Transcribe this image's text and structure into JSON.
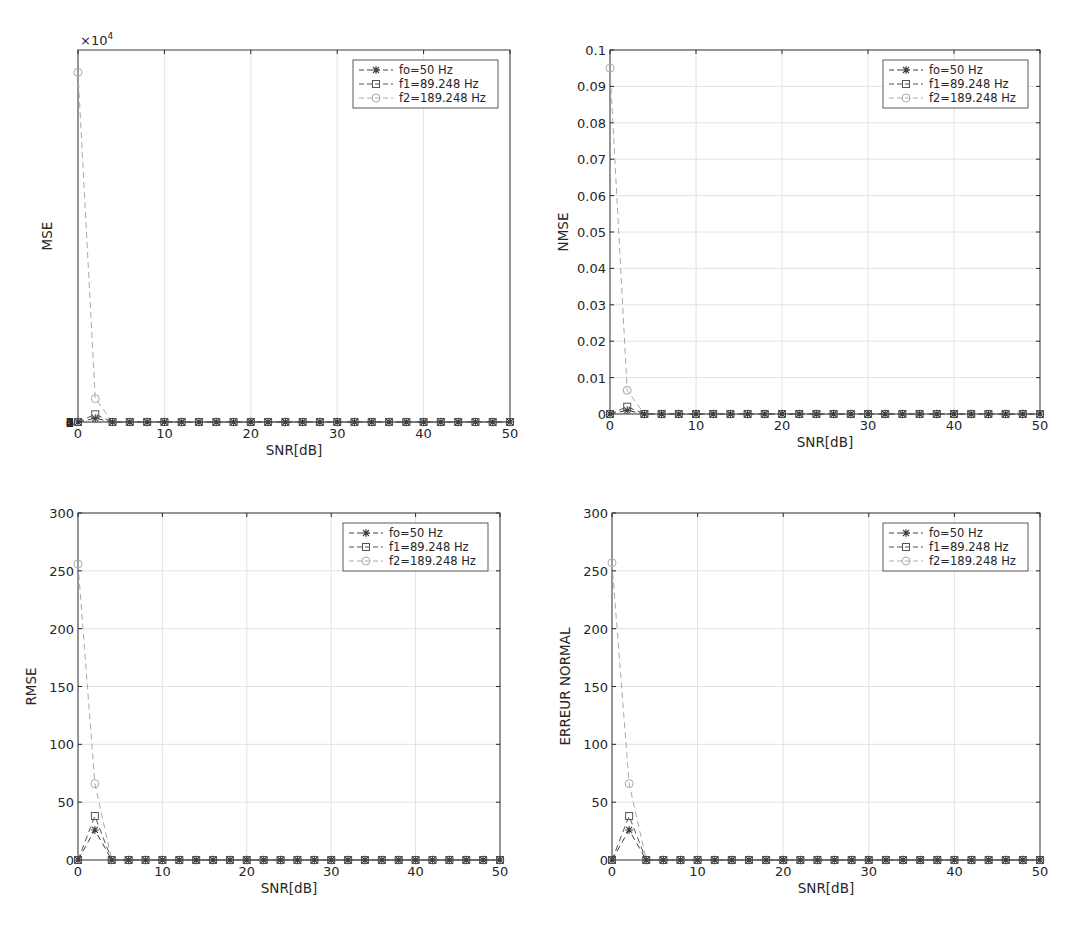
{
  "figure": {
    "layout": "2x2 subplots",
    "grid": true,
    "colors": {
      "fo": "#404040",
      "f1": "#555555",
      "f2": "#aaaaaa",
      "axis": "#262626",
      "grid": "#e2e2e2"
    }
  },
  "legend_entries": [
    {
      "label": "fo=50 Hz",
      "marker": "asterisk"
    },
    {
      "label": "f1=89.248 Hz",
      "marker": "square"
    },
    {
      "label": "f2=189.248 Hz",
      "marker": "circle"
    }
  ],
  "chart_data": [
    {
      "type": "line",
      "title": "",
      "xlabel": "SNR[dB]",
      "ylabel": "MSE",
      "y_exponent_label": "×10^4",
      "xlim": [
        0,
        50
      ],
      "ylim": [
        0,
        70000
      ],
      "xticks": [
        0,
        10,
        20,
        30,
        40,
        50
      ],
      "yticks": [
        0,
        1,
        2,
        3,
        4,
        5,
        6,
        7
      ],
      "ytick_labels": [
        "0",
        "1",
        "2",
        "3",
        "4",
        "5",
        "6",
        "7"
      ],
      "legend_position": "upper right",
      "x": [
        0,
        2,
        4,
        6,
        8,
        10,
        12,
        14,
        16,
        18,
        20,
        22,
        24,
        26,
        28,
        30,
        32,
        34,
        36,
        38,
        40,
        42,
        44,
        46,
        48,
        50
      ],
      "series": [
        {
          "name": "fo=50 Hz",
          "values": [
            0,
            700,
            0,
            0,
            0,
            0,
            0,
            0,
            0,
            0,
            0,
            0,
            0,
            0,
            0,
            0,
            0,
            0,
            0,
            0,
            0,
            0,
            0,
            0,
            0,
            0
          ]
        },
        {
          "name": "f1=89.248 Hz",
          "values": [
            0,
            1450,
            0,
            0,
            0,
            0,
            0,
            0,
            0,
            0,
            0,
            0,
            0,
            0,
            0,
            0,
            0,
            0,
            0,
            0,
            0,
            0,
            0,
            0,
            0,
            0
          ]
        },
        {
          "name": "f2=189.248 Hz",
          "values": [
            65800,
            4400,
            0,
            0,
            0,
            0,
            0,
            0,
            0,
            0,
            0,
            0,
            0,
            0,
            0,
            0,
            0,
            0,
            0,
            0,
            0,
            0,
            0,
            0,
            0,
            0
          ]
        }
      ]
    },
    {
      "type": "line",
      "title": "",
      "xlabel": "SNR[dB]",
      "ylabel": "NMSE",
      "xlim": [
        0,
        50
      ],
      "ylim": [
        0,
        0.1
      ],
      "xticks": [
        0,
        10,
        20,
        30,
        40,
        50
      ],
      "yticks": [
        0,
        0.01,
        0.02,
        0.03,
        0.04,
        0.05,
        0.06,
        0.07,
        0.08,
        0.09,
        0.1
      ],
      "ytick_labels": [
        "0",
        "0.01",
        "0.02",
        "0.03",
        "0.04",
        "0.05",
        "0.06",
        "0.07",
        "0.08",
        "0.09",
        "0.1"
      ],
      "legend_position": "upper right",
      "x": [
        0,
        2,
        4,
        6,
        8,
        10,
        12,
        14,
        16,
        18,
        20,
        22,
        24,
        26,
        28,
        30,
        32,
        34,
        36,
        38,
        40,
        42,
        44,
        46,
        48,
        50
      ],
      "series": [
        {
          "name": "fo=50 Hz",
          "values": [
            0,
            0.001,
            0,
            0,
            0,
            0,
            0,
            0,
            0,
            0,
            0,
            0,
            0,
            0,
            0,
            0,
            0,
            0,
            0,
            0,
            0,
            0,
            0,
            0,
            0,
            0
          ]
        },
        {
          "name": "f1=89.248 Hz",
          "values": [
            0,
            0.002,
            0,
            0,
            0,
            0,
            0,
            0,
            0,
            0,
            0,
            0,
            0,
            0,
            0,
            0,
            0,
            0,
            0,
            0,
            0,
            0,
            0,
            0,
            0,
            0
          ]
        },
        {
          "name": "f2=189.248 Hz",
          "values": [
            0.095,
            0.0065,
            0,
            0,
            0,
            0,
            0,
            0,
            0,
            0,
            0,
            0,
            0,
            0,
            0,
            0,
            0,
            0,
            0,
            0,
            0,
            0,
            0,
            0,
            0,
            0
          ]
        }
      ]
    },
    {
      "type": "line",
      "title": "",
      "xlabel": "SNR[dB]",
      "ylabel": "RMSE",
      "xlim": [
        0,
        50
      ],
      "ylim": [
        0,
        300
      ],
      "xticks": [
        0,
        10,
        20,
        30,
        40,
        50
      ],
      "yticks": [
        0,
        50,
        100,
        150,
        200,
        250,
        300
      ],
      "ytick_labels": [
        "0",
        "50",
        "100",
        "150",
        "200",
        "250",
        "300"
      ],
      "legend_position": "upper right",
      "x": [
        0,
        2,
        4,
        6,
        8,
        10,
        12,
        14,
        16,
        18,
        20,
        22,
        24,
        26,
        28,
        30,
        32,
        34,
        36,
        38,
        40,
        42,
        44,
        46,
        48,
        50
      ],
      "series": [
        {
          "name": "fo=50 Hz",
          "values": [
            0,
            26,
            0,
            0,
            0,
            0,
            0,
            0,
            0,
            0,
            0,
            0,
            0,
            0,
            0,
            0,
            0,
            0,
            0,
            0,
            0,
            0,
            0,
            0,
            0,
            0
          ]
        },
        {
          "name": "f1=89.248 Hz",
          "values": [
            0,
            38,
            0,
            0,
            0,
            0,
            0,
            0,
            0,
            0,
            0,
            0,
            0,
            0,
            0,
            0,
            0,
            0,
            0,
            0,
            0,
            0,
            0,
            0,
            0,
            0
          ]
        },
        {
          "name": "f2=189.248 Hz",
          "values": [
            256,
            66,
            0,
            0,
            0,
            0,
            0,
            0,
            0,
            0,
            0,
            0,
            0,
            0,
            0,
            0,
            0,
            0,
            0,
            0,
            0,
            0,
            0,
            0,
            0,
            0
          ]
        }
      ]
    },
    {
      "type": "line",
      "title": "",
      "xlabel": "SNR[dB]",
      "ylabel": "ERREUR NORMAL",
      "xlim": [
        0,
        50
      ],
      "ylim": [
        0,
        300
      ],
      "xticks": [
        0,
        10,
        20,
        30,
        40,
        50
      ],
      "yticks": [
        0,
        50,
        100,
        150,
        200,
        250,
        300
      ],
      "ytick_labels": [
        "0",
        "50",
        "100",
        "150",
        "200",
        "250",
        "300"
      ],
      "legend_position": "upper right",
      "x": [
        0,
        2,
        4,
        6,
        8,
        10,
        12,
        14,
        16,
        18,
        20,
        22,
        24,
        26,
        28,
        30,
        32,
        34,
        36,
        38,
        40,
        42,
        44,
        46,
        48,
        50
      ],
      "series": [
        {
          "name": "fo=50 Hz",
          "values": [
            0,
            26,
            0,
            0,
            0,
            0,
            0,
            0,
            0,
            0,
            0,
            0,
            0,
            0,
            0,
            0,
            0,
            0,
            0,
            0,
            0,
            0,
            0,
            0,
            0,
            0
          ]
        },
        {
          "name": "f1=89.248 Hz",
          "values": [
            0,
            38,
            0,
            0,
            0,
            0,
            0,
            0,
            0,
            0,
            0,
            0,
            0,
            0,
            0,
            0,
            0,
            0,
            0,
            0,
            0,
            0,
            0,
            0,
            0,
            0
          ]
        },
        {
          "name": "f2=189.248 Hz",
          "values": [
            257,
            66,
            0,
            0,
            0,
            0,
            0,
            0,
            0,
            0,
            0,
            0,
            0,
            0,
            0,
            0,
            0,
            0,
            0,
            0,
            0,
            0,
            0,
            0,
            0,
            0
          ]
        }
      ]
    }
  ]
}
